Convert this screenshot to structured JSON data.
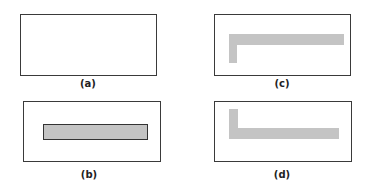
{
  "panels": [
    {
      "id": "a",
      "label": "(a)",
      "content": "empty"
    },
    {
      "id": "b",
      "label": "(b)",
      "content": "horizontal outlined gray bar"
    },
    {
      "id": "c",
      "label": "(c)",
      "content": "gray L-shape, horizontal bar on top with leg extending down at left"
    },
    {
      "id": "d",
      "label": "(d)",
      "content": "gray L-shape, vertical leg at left with horizontal bar at bottom"
    }
  ],
  "colors": {
    "frame": "#3a3a3a",
    "fill": "#c4c4c4"
  }
}
